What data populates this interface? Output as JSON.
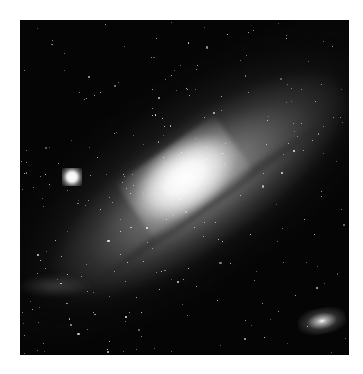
{
  "image": {
    "subject": "Andromeda Galaxy with satellite galaxies",
    "background_color": "#050505",
    "page_background": "#ffffff",
    "frame": {
      "x": 20,
      "y": 20,
      "width": 329,
      "height": 335
    },
    "features": [
      {
        "name": "galaxy-core",
        "cx": 185,
        "cy": 178,
        "color": "#ffffff"
      },
      {
        "name": "satellite-galaxy-left",
        "cx": 72,
        "cy": 177,
        "color": "#ffffff"
      },
      {
        "name": "satellite-galaxy-lower-right",
        "cx": 321,
        "cy": 320,
        "color": "#ffffff"
      }
    ],
    "star_count": 260
  }
}
